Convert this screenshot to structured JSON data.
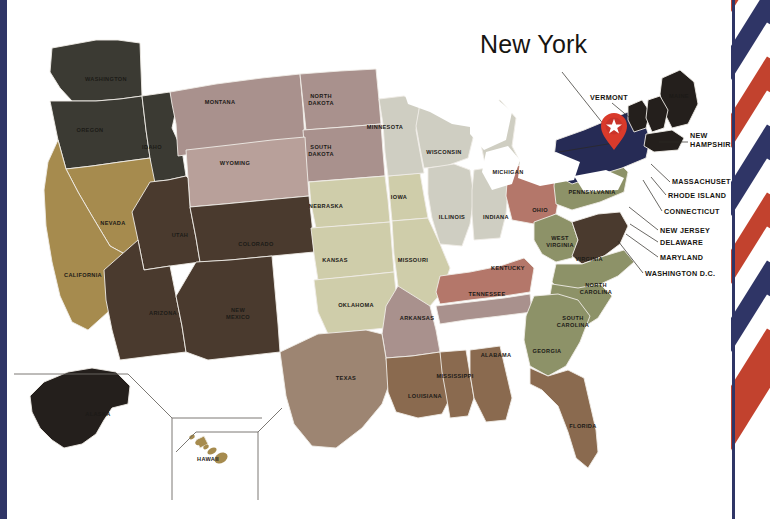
{
  "map": {
    "title": "New York",
    "marker": {
      "name": "pin-marker",
      "glyph": "star",
      "color": "#d93a2b",
      "state": "New York"
    },
    "palette": {
      "charcoal": "#3b3a33",
      "near_black": "#241f1c",
      "navy_highlight": "#262b55",
      "gold": "#a68b4e",
      "dark_brown": "#4a3a2e",
      "mauve": "#a9918d",
      "rose": "#b8a09a",
      "sage": "#cfcdaa",
      "pale_grey": "#cfcec2",
      "olive": "#8d9268",
      "terracotta": "#b4776a",
      "taupe": "#9d8572",
      "brown": "#8a6a4f",
      "lake_white": "#ffffff",
      "ribbon_red": "#c2422e",
      "ribbon_navy": "#2f3566",
      "border": "#efece6"
    },
    "states": [
      {
        "id": "WA",
        "label": "WASHINGTON",
        "fill": "#3b3a33",
        "lx": 106,
        "ly": 81
      },
      {
        "id": "OR",
        "label": "OREGON",
        "fill": "#3b3a33",
        "lx": 90,
        "ly": 132
      },
      {
        "id": "ID",
        "label": "IDAHO",
        "fill": "#3b3a33",
        "lx": 152,
        "ly": 149
      },
      {
        "id": "MT",
        "label": "MONTANA",
        "fill": "#a9918d",
        "lx": 220,
        "ly": 104
      },
      {
        "id": "ND",
        "label": "NORTH|DAKOTA",
        "fill": "#a9918d",
        "lx": 321,
        "ly": 98
      },
      {
        "id": "SD",
        "label": "SOUTH|DAKOTA",
        "fill": "#a9918d",
        "lx": 321,
        "ly": 149
      },
      {
        "id": "WY",
        "label": "WYOMING",
        "fill": "#b8a09a",
        "lx": 235,
        "ly": 165
      },
      {
        "id": "NE",
        "label": "NEBRASKA",
        "fill": "#cfcdaa",
        "lx": 326,
        "ly": 208
      },
      {
        "id": "IA",
        "label": "IOWA",
        "fill": "#cfcdaa",
        "lx": 399,
        "ly": 199
      },
      {
        "id": "MN",
        "label": "MINNESOTA",
        "fill": "#cfcec2",
        "lx": 385,
        "ly": 129
      },
      {
        "id": "WI",
        "label": "WISCONSIN",
        "fill": "#cfcec2",
        "lx": 444,
        "ly": 154
      },
      {
        "id": "MI",
        "label": "MICHIGAN",
        "fill": "#cfcec2",
        "lx": 508,
        "ly": 174
      },
      {
        "id": "IL",
        "label": "ILLINOIS",
        "fill": "#cfcec2",
        "lx": 452,
        "ly": 219
      },
      {
        "id": "IN",
        "label": "INDIANA",
        "fill": "#cfcec2",
        "lx": 496,
        "ly": 219
      },
      {
        "id": "OH",
        "label": "OHIO",
        "fill": "#b4776a",
        "lx": 540,
        "ly": 212
      },
      {
        "id": "NV",
        "label": "NEVADA",
        "fill": "#a68b4e",
        "lx": 113,
        "ly": 225
      },
      {
        "id": "CA",
        "label": "CALIFORNIA",
        "fill": "#a68b4e",
        "lx": 83,
        "ly": 277
      },
      {
        "id": "UT",
        "label": "UTAH",
        "fill": "#4a3a2e",
        "lx": 180,
        "ly": 237
      },
      {
        "id": "AZ",
        "label": "ARIZONA",
        "fill": "#4a3a2e",
        "lx": 163,
        "ly": 315
      },
      {
        "id": "CO",
        "label": "COLORADO",
        "fill": "#4a3a2e",
        "lx": 256,
        "ly": 246
      },
      {
        "id": "NM",
        "label": "NEW|MEXICO",
        "fill": "#4a3a2e",
        "lx": 238,
        "ly": 312
      },
      {
        "id": "KS",
        "label": "KANSAS",
        "fill": "#cfcdaa",
        "lx": 335,
        "ly": 262
      },
      {
        "id": "OK",
        "label": "OKLAHOMA",
        "fill": "#cfcdaa",
        "lx": 356,
        "ly": 307
      },
      {
        "id": "MO",
        "label": "MISSOURI",
        "fill": "#cfcdaa",
        "lx": 413,
        "ly": 262
      },
      {
        "id": "AR",
        "label": "ARKANSAS",
        "fill": "#a9918d",
        "lx": 417,
        "ly": 320
      },
      {
        "id": "TX",
        "label": "TEXAS",
        "fill": "#9d8572",
        "lx": 346,
        "ly": 380
      },
      {
        "id": "LA",
        "label": "LOUISIANA",
        "fill": "#8a6a4f",
        "lx": 425,
        "ly": 398
      },
      {
        "id": "MS",
        "label": "MISSISSIPPI",
        "fill": "#8a6a4f",
        "lx": 455,
        "ly": 378
      },
      {
        "id": "AL",
        "label": "ALABAMA",
        "fill": "#8a6a4f",
        "lx": 496,
        "ly": 357
      },
      {
        "id": "TN",
        "label": "TENNESSEE",
        "fill": "#a9918d",
        "lx": 487,
        "ly": 296
      },
      {
        "id": "KY",
        "label": "KENTUCKY",
        "fill": "#b4776a",
        "lx": 508,
        "ly": 270
      },
      {
        "id": "WV",
        "label": "WEST|VIRGINIA",
        "fill": "#8d9268",
        "lx": 560,
        "ly": 240
      },
      {
        "id": "VA",
        "label": "VIRGINIA",
        "fill": "#4a3a2e",
        "lx": 589,
        "ly": 261
      },
      {
        "id": "NC",
        "label": "NORTH|CAROLINA",
        "fill": "#8d9268",
        "lx": 596,
        "ly": 287
      },
      {
        "id": "SC",
        "label": "SOUTH|CAROLINA",
        "fill": "#8d9268",
        "lx": 573,
        "ly": 320
      },
      {
        "id": "GA",
        "label": "GEORGIA",
        "fill": "#8d9268",
        "lx": 547,
        "ly": 353
      },
      {
        "id": "FL",
        "label": "FLORIDA",
        "fill": "#8a6a4f",
        "lx": 583,
        "ly": 428
      },
      {
        "id": "PA",
        "label": "PENNSYLVANIA",
        "fill": "#8d9268",
        "lx": 592,
        "ly": 194
      },
      {
        "id": "NY",
        "label": "",
        "fill": "#262b55",
        "lx": 0,
        "ly": 0
      },
      {
        "id": "ME",
        "label": "MAINE",
        "fill": "#241f1c",
        "lx": 679,
        "ly": 98
      },
      {
        "id": "VT",
        "label": "",
        "fill": "#241f1c",
        "lx": 0,
        "ly": 0
      },
      {
        "id": "NH",
        "label": "",
        "fill": "#241f1c",
        "lx": 0,
        "ly": 0
      },
      {
        "id": "MA",
        "label": "",
        "fill": "#241f1c",
        "lx": 0,
        "ly": 0
      },
      {
        "id": "AK",
        "label": "ALASKA",
        "fill": "#241f1c",
        "lx": 98,
        "ly": 416
      },
      {
        "id": "HI",
        "label": "HAWAII",
        "fill": "#a68b4e",
        "lx": 208,
        "ly": 461
      }
    ],
    "callouts": [
      {
        "id": "VT",
        "label": "VERMONT",
        "tx": 590,
        "ty": 100,
        "anchor": "end",
        "lx1": 612,
        "ly1": 103,
        "lx2": 630,
        "ly2": 118
      },
      {
        "id": "NH",
        "label": "NEW|HAMPSHIRE",
        "tx": 690,
        "ty": 138,
        "anchor": "start",
        "lx1": 688,
        "ly1": 142,
        "lx2": 659,
        "ly2": 142
      },
      {
        "id": "MA",
        "label": "MASSACHUSETTS",
        "tx": 672,
        "ty": 184,
        "anchor": "start",
        "lx1": 670,
        "ly1": 182,
        "lx2": 651,
        "ly2": 164
      },
      {
        "id": "RI",
        "label": "RHODE ISLAND",
        "tx": 668,
        "ty": 198,
        "anchor": "start",
        "lx1": 666,
        "ly1": 195,
        "lx2": 651,
        "ly2": 177
      },
      {
        "id": "CT",
        "label": "CONNECTICUT",
        "tx": 664,
        "ty": 214,
        "anchor": "start",
        "lx1": 662,
        "ly1": 211,
        "lx2": 643,
        "ly2": 180
      },
      {
        "id": "NJ",
        "label": "NEW JERSEY",
        "tx": 660,
        "ty": 233,
        "anchor": "start",
        "lx1": 658,
        "ly1": 230,
        "lx2": 629,
        "ly2": 207
      },
      {
        "id": "DE",
        "label": "DELAWARE",
        "tx": 660,
        "ty": 245,
        "anchor": "start",
        "lx1": 658,
        "ly1": 242,
        "lx2": 630,
        "ly2": 224
      },
      {
        "id": "MD",
        "label": "MARYLAND",
        "tx": 660,
        "ty": 260,
        "anchor": "start",
        "lx1": 658,
        "ly1": 257,
        "lx2": 626,
        "ly2": 234
      },
      {
        "id": "DC",
        "label": "WASHINGTON D.C.",
        "tx": 645,
        "ty": 276,
        "anchor": "start",
        "lx1": 643,
        "ly1": 273,
        "lx2": 618,
        "ly2": 241
      }
    ],
    "insets": {
      "alaska_label": "ALASKA",
      "hawaii_label": "HAWAII"
    }
  }
}
